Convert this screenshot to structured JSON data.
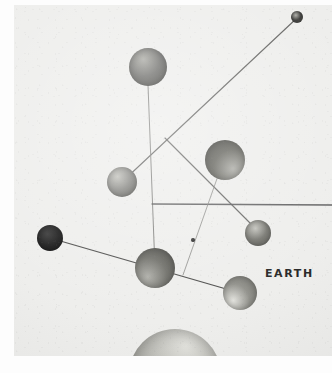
{
  "image": {
    "kind": "photograph",
    "subject": "solar-system-mobile-model",
    "background_color": "#eeeeec",
    "border_color": "#ffffff",
    "width": 332,
    "height": 373
  },
  "photo": {
    "left": 14,
    "top": 5,
    "width": 318,
    "height": 351
  },
  "labels": [
    {
      "id": "earth",
      "text": "EARTH",
      "x": 251,
      "y": 262,
      "font_size": 11,
      "color": "#2a2a2a"
    }
  ],
  "spheres": [
    {
      "id": "sphere-top",
      "cx": 134,
      "cy": 62,
      "r": 19,
      "tone": "#6f6f6c",
      "shade": "dark",
      "highlight_x": 38,
      "highlight_y": 30
    },
    {
      "id": "sphere-mid-left",
      "cx": 108,
      "cy": 177,
      "r": 15,
      "tone": "#858581",
      "shade": "medium",
      "highlight_x": 35,
      "highlight_y": 32
    },
    {
      "id": "sphere-right-large",
      "cx": 211,
      "cy": 155,
      "r": 20,
      "tone": "#66665f",
      "shade": "dark",
      "highlight_x": 70,
      "highlight_y": 72
    },
    {
      "id": "sphere-far-left-dark",
      "cx": 36,
      "cy": 233,
      "r": 13,
      "tone": "#1c1c1c",
      "shade": "black",
      "highlight_x": 40,
      "highlight_y": 35
    },
    {
      "id": "sphere-right-small",
      "cx": 244,
      "cy": 228,
      "r": 13,
      "tone": "#74746e",
      "shade": "medium",
      "highlight_x": 40,
      "highlight_y": 32
    },
    {
      "id": "sphere-center-low",
      "cx": 141,
      "cy": 263,
      "r": 20,
      "tone": "#6d6d67",
      "shade": "dark",
      "highlight_x": 32,
      "highlight_y": 72
    },
    {
      "id": "sphere-earth",
      "cx": 226,
      "cy": 288,
      "r": 17,
      "tone": "#92928c",
      "shade": "light",
      "highlight_x": 30,
      "highlight_y": 72
    },
    {
      "id": "sphere-bottom-big",
      "cx": 161,
      "cy": 370,
      "r": 46,
      "tone": "#b4b4ae",
      "shade": "light",
      "highlight_x": 62,
      "highlight_y": 18
    },
    {
      "id": "bead-small",
      "cx": 179,
      "cy": 235,
      "r": 2,
      "tone": "#2b2b2b",
      "shade": "black",
      "highlight_x": 40,
      "highlight_y": 35
    },
    {
      "id": "tip-top-right",
      "cx": 283,
      "cy": 12,
      "r": 6,
      "tone": "#3a3a38",
      "shade": "dark",
      "highlight_x": 40,
      "highlight_y": 35
    }
  ],
  "rods": [
    {
      "id": "rod-long-diagonal",
      "x1": 283,
      "y1": 13,
      "x2": 108,
      "y2": 177,
      "width": 1.1,
      "color": "#5a5a58"
    },
    {
      "id": "rod-top-vertical",
      "x1": 134,
      "y1": 80,
      "x2": 141,
      "y2": 263,
      "width": 1.0,
      "color": "#7b7b78"
    },
    {
      "id": "rod-branch-right",
      "x1": 151,
      "y1": 133,
      "x2": 244,
      "y2": 226,
      "width": 1.1,
      "color": "#5c5c5a"
    },
    {
      "id": "rod-horizontal",
      "x1": 138,
      "y1": 199,
      "x2": 318,
      "y2": 200,
      "width": 1.3,
      "color": "#59595a"
    },
    {
      "id": "rod-thin-vertical",
      "x1": 205,
      "y1": 168,
      "x2": 169,
      "y2": 270,
      "width": 0.9,
      "color": "#8a8a87"
    },
    {
      "id": "rod-lower-diagonal",
      "x1": 36,
      "y1": 233,
      "x2": 226,
      "y2": 288,
      "width": 1.2,
      "color": "#3f3f3e"
    }
  ]
}
